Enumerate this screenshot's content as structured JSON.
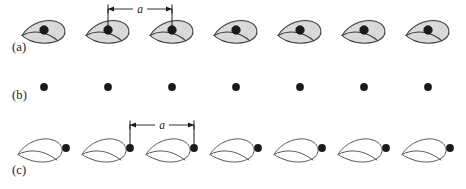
{
  "figure": {
    "background_color": "#ffffff",
    "width": 466,
    "height": 189,
    "ink_color": "#1a1a1a",
    "motif_fill": "#d9d9d9",
    "motif_stroke": "#3a3a3a",
    "lattice_dot_color": "#1a1a1a"
  },
  "rows": [
    {
      "id": "a",
      "label": "(a)",
      "description": "row of shaded comma motifs with lattice point inside each",
      "motif_count": 7,
      "motif_style": "filled",
      "dot_count": 7,
      "dot_start_x": 44,
      "dot_spacing": 64,
      "baseline_y": 30,
      "dimension": {
        "label": "a",
        "from_x": 108,
        "to_x": 172,
        "line_y": 9,
        "drop_to_y": 30,
        "visible": true
      }
    },
    {
      "id": "b",
      "label": "(b)",
      "description": "bare Bravais lattice points",
      "motif_count": 0,
      "motif_style": "none",
      "dot_count": 7,
      "dot_start_x": 44,
      "dot_spacing": 64,
      "baseline_y": 87,
      "dimension": {
        "visible": false
      }
    },
    {
      "id": "c",
      "label": "(c)",
      "description": "row of outline leaf motifs with lattice points between them",
      "motif_count": 7,
      "motif_style": "outline",
      "dot_count": 7,
      "dot_start_x": 66,
      "dot_spacing": 64,
      "baseline_y": 148,
      "dimension": {
        "label": "a",
        "from_x": 130,
        "to_x": 194,
        "line_y": 125,
        "drop_to_y": 148,
        "visible": true
      }
    }
  ],
  "dimension_labels": {
    "lattice_constant": "a"
  },
  "labels": {
    "row_a": "(a)",
    "row_b": "(b)",
    "row_c": "(c)"
  }
}
